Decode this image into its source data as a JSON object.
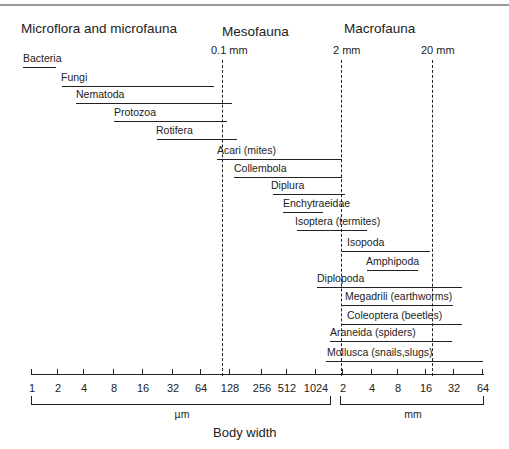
{
  "headings": {
    "micro": "Microflora and microfauna",
    "meso": "Mesofauna",
    "macro": "Macrofauna"
  },
  "thresholds": [
    {
      "label": "0.1 mm",
      "x": 223,
      "label_x": 211
    },
    {
      "label": "2 mm",
      "x": 342,
      "label_x": 333
    },
    {
      "label": "20 mm",
      "x": 433,
      "label_x": 421
    }
  ],
  "groups": [
    {
      "name": "Bacteria",
      "x1": 23,
      "x2": 56,
      "y": 67,
      "label_x": 23
    },
    {
      "name": "Fungi",
      "x1": 62,
      "x2": 214,
      "y": 86,
      "label_x": 61
    },
    {
      "name": "Nematoda",
      "x1": 76,
      "x2": 232,
      "y": 103,
      "label_x": 76
    },
    {
      "name": "Protozoa",
      "x1": 114,
      "x2": 227,
      "y": 121,
      "label_x": 114
    },
    {
      "name": "Rotifera",
      "x1": 157,
      "x2": 237,
      "y": 139,
      "label_x": 156
    },
    {
      "name": "Acari (mites)",
      "x1": 217,
      "x2": 342,
      "y": 159,
      "label_x": 217
    },
    {
      "name": "Collembola",
      "x1": 234,
      "x2": 342,
      "y": 177,
      "label_x": 234
    },
    {
      "name": "Diplura",
      "x1": 273,
      "x2": 345,
      "y": 194,
      "label_x": 271
    },
    {
      "name": "Enchytraeidae",
      "x1": 283,
      "x2": 323,
      "y": 212,
      "label_x": 283
    },
    {
      "name": "Isoptera (termites)",
      "x1": 297,
      "x2": 367,
      "y": 230,
      "label_x": 295
    },
    {
      "name": "Isopoda",
      "x1": 342,
      "x2": 430,
      "y": 251,
      "label_x": 347
    },
    {
      "name": "Amphipoda",
      "x1": 367,
      "x2": 418,
      "y": 270,
      "label_x": 366
    },
    {
      "name": "Diplopoda",
      "x1": 317,
      "x2": 462,
      "y": 287,
      "label_x": 317
    },
    {
      "name": "Megadrili (earthworms)",
      "x1": 342,
      "x2": 453,
      "y": 305,
      "label_x": 345
    },
    {
      "name": "Coleoptera (beetles)",
      "x1": 342,
      "x2": 462,
      "y": 324,
      "label_x": 347
    },
    {
      "name": "Araneida (spiders)",
      "x1": 330,
      "x2": 452,
      "y": 341,
      "label_x": 330
    },
    {
      "name": "Mollusca (snails,slugs)",
      "x1": 326,
      "x2": 483,
      "y": 361,
      "label_x": 327
    }
  ],
  "axis": {
    "y": 374,
    "x1": 31,
    "x2": 483,
    "ticks": [
      {
        "label": "1",
        "x": 31
      },
      {
        "label": "2",
        "x": 57
      },
      {
        "label": "4",
        "x": 83
      },
      {
        "label": "8",
        "x": 113
      },
      {
        "label": "16",
        "x": 142
      },
      {
        "label": "32",
        "x": 172
      },
      {
        "label": "64",
        "x": 200
      },
      {
        "label": "128",
        "x": 229
      },
      {
        "label": "256",
        "x": 261
      },
      {
        "label": "512",
        "x": 286
      },
      {
        "label": "1024",
        "x": 315
      },
      {
        "label": "2",
        "x": 342
      },
      {
        "label": "4",
        "x": 371
      },
      {
        "label": "8",
        "x": 397
      },
      {
        "label": "16",
        "x": 425
      },
      {
        "label": "32",
        "x": 453
      },
      {
        "label": "64",
        "x": 482
      }
    ],
    "units": [
      {
        "label": "µm",
        "x1": 31,
        "x2": 329,
        "label_x": 182
      },
      {
        "label": "mm",
        "x1": 340,
        "x2": 482,
        "label_x": 413
      }
    ],
    "title": "Body width"
  }
}
